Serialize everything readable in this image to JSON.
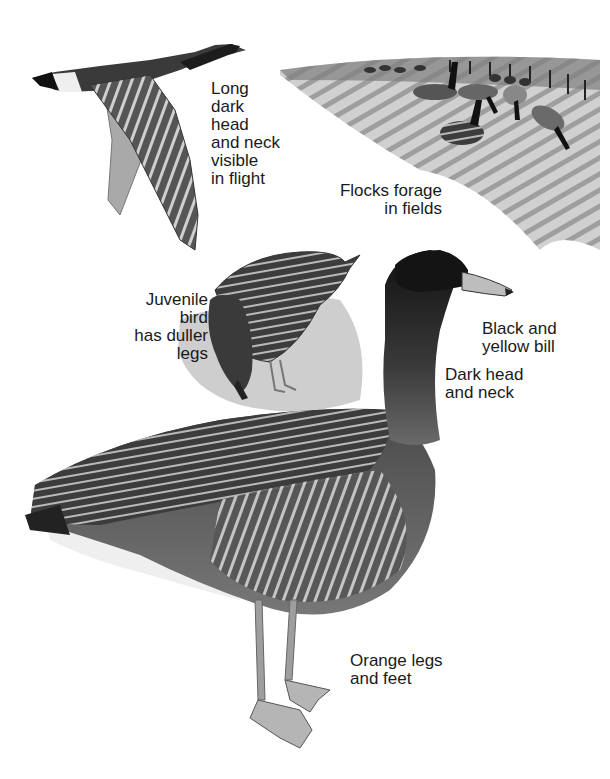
{
  "illustration": {
    "subject": "Pink-footed / bean-type goose field guide plate",
    "labels": {
      "flight": "Long\ndark\nhead\nand neck\nvisible\nin flight",
      "flocks": "Flocks forage\nin fields",
      "juvenile": "Juvenile\nbird\nhas duller\nlegs",
      "bill": "Black and\nyellow bill",
      "head_neck": "Dark head\nand neck",
      "legs": "Orange legs\nand feet"
    },
    "figures": [
      {
        "name": "goose-in-flight",
        "description": "Goose flying to the right, long dark neck extended"
      },
      {
        "name": "flock-in-field",
        "description": "Flock of geese foraging in a ploughed field with fence line"
      },
      {
        "name": "juvenile-goose",
        "description": "Juvenile goose feeding, head down"
      },
      {
        "name": "adult-goose",
        "description": "Standing adult goose, side view"
      }
    ],
    "colors": {
      "ink": "#1a1a1a",
      "dark_feather": "#2b2b2b",
      "mid_feather": "#6e6e6e",
      "light_feather": "#bdbdbd",
      "field": "#9a9a9a",
      "background": "#ffffff"
    }
  }
}
